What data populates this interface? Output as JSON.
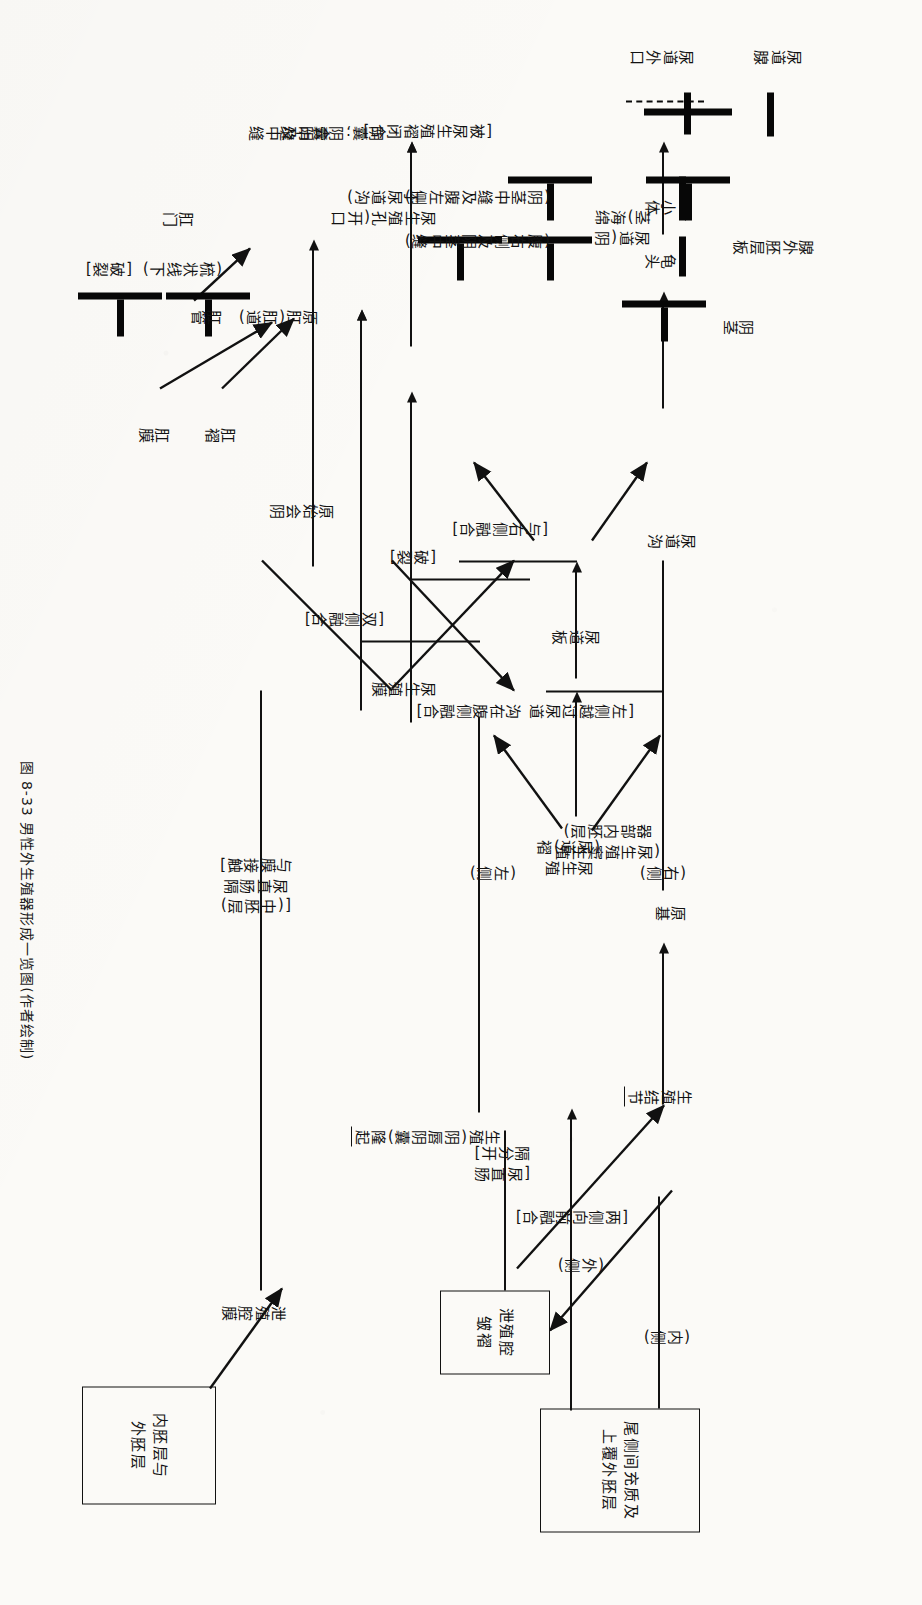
{
  "figure": {
    "caption": "图 8-33  男性外生殖器形成一览图(作者绘制)",
    "orientation": "rotated-90-clockwise",
    "ink_color": "#111111",
    "paper_color": "#fbfaf7"
  },
  "boxes": [
    {
      "id": "caudal-mesenchyme",
      "text": "尾侧间充质及\n上覆外胚层"
    },
    {
      "id": "cloacal-fold",
      "text": "泄殖腔\n皱褶"
    },
    {
      "id": "endo-ecto",
      "text": "内胚层与\n外胚层"
    }
  ],
  "nodes": {
    "genital_tubercle": "生殖结节",
    "primordium": "原基",
    "penis": "阴茎",
    "glans": "龟头",
    "corpuscle": "小体",
    "glandular_ectodermal_plate": "腺外胚层板",
    "urethral_external_orifice": "尿道外口",
    "urethral_gland": "尿道腺",
    "urogenital_urethral_fold": "尿生殖\n(尿道)褶",
    "urethral_plate": "尿道板",
    "urethral_groove": "尿道沟",
    "urethra_corpus_spongiosum": "尿道(阴\n茎)海绵",
    "urogenital_membrane": "尿生殖膜",
    "urogenital_orifice": "尿生殖孔(开口\n于尿道沟)",
    "scrotum_raphe": "阴囊;阴囊中缝",
    "primitive_perineum": "原始会阴",
    "perineum_raphe": "会阴及中缝",
    "anal_fold": "肛褶",
    "anal_membrane": "肛膜",
    "proctodeum": "原肛(肛道)",
    "anal_canal": "肛管",
    "below_pectinate_line": "(梳状线下)",
    "anus": "肛门",
    "cloacal_membrane": "泄殖腔膜",
    "genital_labioscrotal_swelling": "生殖(阴唇阴囊)隆起"
  },
  "edge_labels": {
    "medial": "(内侧)",
    "lateral": "(外侧)",
    "right_side": "(右侧)",
    "left_side": "(左侧)",
    "bilateral_anterior_fusion": "[两侧向前融合]",
    "urorectal_septum_separates": "[尿直肠\n隔分开]",
    "urogenital_sinus_endoderm": "(尿生殖窦生殖\n器部内胚层)",
    "left_crosses_urethral_groove": "[左侧越过尿道\n沟在腹侧融合]",
    "fuse_with_right": "[与右侧融合]",
    "ruptures": "[破裂]",
    "bilateral_fusion": "[双侧融合]",
    "closed_by_urogenital_fold": "[被尿生殖褶闭合]",
    "ventral_right_and_penile_raphe": "(腹右侧及阴茎中缝)",
    "penile_raphe_and_ventral_left": "(阴茎中缝及腹左侧)",
    "mesoderm_urorectal_contacts": "[(中胚层)\n尿直肠隔\n与膜接触]",
    "ruptures_anal": "[破裂]"
  }
}
